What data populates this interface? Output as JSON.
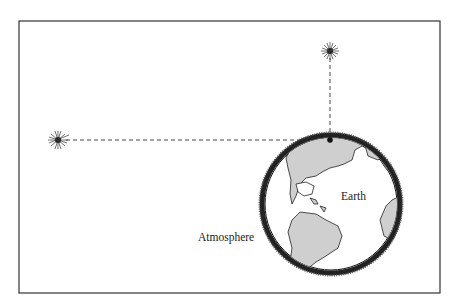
{
  "diagram": {
    "type": "refraction-illustration",
    "labels": {
      "earth": "Earth",
      "atmosphere": "Atmosphere"
    },
    "elements": [
      {
        "id": "star-overhead",
        "kind": "star",
        "description": "star directly overhead (zenith)"
      },
      {
        "id": "star-horizon",
        "kind": "star",
        "description": "star on the horizon"
      },
      {
        "id": "observer",
        "kind": "point",
        "description": "observer on Earth's surface"
      },
      {
        "id": "earth",
        "kind": "globe",
        "label": "Earth"
      },
      {
        "id": "atmosphere",
        "kind": "shell",
        "label": "Atmosphere"
      }
    ],
    "colors": {
      "land": "#cfcfcf",
      "ocean": "#ffffff",
      "outline": "#1a1a1a",
      "atmosphere": "#222222",
      "frame": "#333333"
    }
  }
}
